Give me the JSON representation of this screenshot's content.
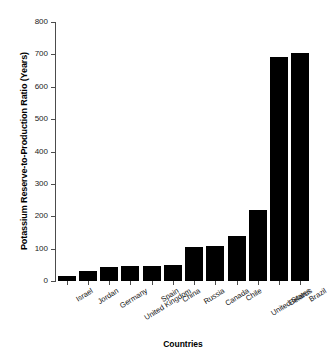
{
  "chart_data": {
    "type": "bar",
    "title": "",
    "xlabel": "Countries",
    "ylabel": "Potassium Reserve-to-Production Ratio (Years)",
    "categories": [
      "Israel",
      "Jordan",
      "Germany",
      "United Kingdom",
      "Spain",
      "China",
      "Russia",
      "Canada",
      "Chile",
      "United States",
      "Belarus",
      "Brazil"
    ],
    "values": [
      16,
      32,
      43,
      45,
      45,
      48,
      105,
      108,
      138,
      218,
      692,
      705
    ],
    "ylim": [
      0,
      800
    ],
    "ytick_labels": [
      "0",
      "100",
      "200",
      "300",
      "400",
      "500",
      "600",
      "700",
      "800"
    ],
    "ytick_values": [
      0,
      100,
      200,
      300,
      400,
      500,
      600,
      700,
      800
    ],
    "grid": false,
    "legend": null,
    "bar_color": "#000000",
    "axis_color": "#4c4c4c",
    "background_color": "#ffffff"
  }
}
